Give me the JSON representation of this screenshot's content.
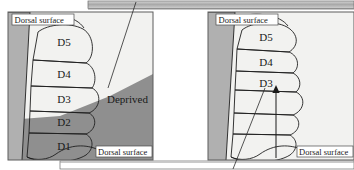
{
  "figure": {
    "title_bar_top": "",
    "title_bar_bottom": "",
    "panels": [
      {
        "id": "left-panel",
        "name": "deprived-map-panel",
        "background_zones": {
          "upper_light_label": "",
          "lower_shaded_label": ""
        },
        "digits": [
          {
            "label": "D5",
            "shade": "dark"
          },
          {
            "label": "D4",
            "shade": "dark"
          },
          {
            "label": "D3",
            "shade": "light"
          },
          {
            "label": "D2",
            "shade": "light"
          },
          {
            "label": "D1",
            "shade": "light"
          }
        ],
        "annotations": [
          {
            "name": "dorsal-surface-top",
            "text": "Dorsal surface"
          },
          {
            "name": "dorsal-surface-bottom",
            "text": "Dorsal surface"
          },
          {
            "name": "deprived-region",
            "text": "Deprived"
          }
        ]
      },
      {
        "id": "right-panel",
        "name": "recovered-map-panel",
        "digits": [
          {
            "label": "D5",
            "shade": "dark"
          },
          {
            "label": "D4",
            "shade": "dark"
          },
          {
            "label": "D3",
            "shade": "dark"
          },
          {
            "label": "",
            "shade": "light"
          },
          {
            "label": "",
            "shade": "light"
          },
          {
            "label": "",
            "shade": "light"
          }
        ],
        "annotations": [
          {
            "name": "dorsal-surface-top",
            "text": "Dorsal surface"
          },
          {
            "name": "dorsal-surface-bottom",
            "text": "Dorsal surface"
          }
        ],
        "arrow": {
          "name": "expansion-arrow",
          "direction": "up"
        }
      }
    ]
  },
  "colors": {
    "digit_dark": "#6e6e6e",
    "digit_light": "#b9b9b9",
    "background_light": "#f2f2f0",
    "background_shaded": "#8f8f8f",
    "panel_side_band": "#b0b0b0",
    "bar_fill": "#b5b5b5",
    "outline": "#1f1f1f",
    "text": "#1a1a1a"
  }
}
